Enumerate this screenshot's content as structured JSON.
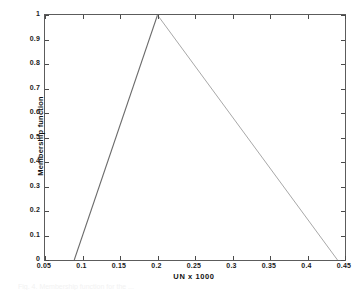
{
  "figure": {
    "caption_partial": "Fig. 4. Membership function for the ..."
  },
  "chart_data": {
    "type": "line",
    "title": "",
    "subtitle": "",
    "xlabel": "UN x 1000",
    "ylabel": "Membership function",
    "xlim": [
      0.05,
      0.45
    ],
    "ylim": [
      0,
      1
    ],
    "grid": false,
    "legend": null,
    "xticks": [
      0.05,
      0.1,
      0.15,
      0.2,
      0.25,
      0.3,
      0.35,
      0.4,
      0.45
    ],
    "xticklabels": [
      "0.05",
      "0.1",
      "0.15",
      "0.2",
      "0.25",
      "0.3",
      "0.35",
      "0.4",
      "0.45"
    ],
    "yticks": [
      0,
      0.1,
      0.2,
      0.3,
      0.4,
      0.5,
      0.6,
      0.7,
      0.8,
      0.9,
      1
    ],
    "yticklabels": [
      "0",
      "0.1",
      "0.2",
      "0.3",
      "0.4",
      "0.5",
      "0.6",
      "0.7",
      "0.8",
      "0.9",
      "1"
    ],
    "series": [
      {
        "name": "rising-edge",
        "color": "#6b6b6b",
        "x": [
          0.089,
          0.2
        ],
        "values": [
          0,
          1
        ]
      },
      {
        "name": "falling-edge",
        "color": "#a8a8a8",
        "x": [
          0.2,
          0.44
        ],
        "values": [
          1,
          0
        ]
      }
    ],
    "annotations": [
      {
        "label": "left-foot",
        "x": 0.089,
        "y": 0
      },
      {
        "label": "peak",
        "x": 0.2,
        "y": 1
      },
      {
        "label": "right-foot",
        "x": 0.44,
        "y": 0
      }
    ]
  }
}
